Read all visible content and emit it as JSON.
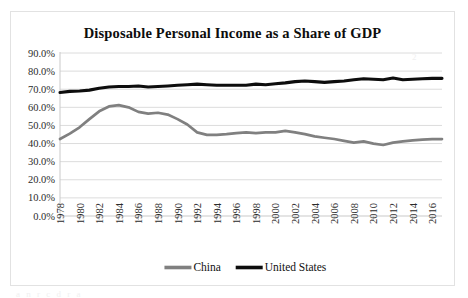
{
  "chart": {
    "title": "Disposable Personal Income as a Share of GDP",
    "frame_border_color": "#e2e2e2",
    "gridline_color": "#dcdcdc"
  },
  "legend": {
    "position": "bottom-center",
    "entries": [
      {
        "label": "China",
        "color": "#808080"
      },
      {
        "label": "United States",
        "color": "#0d0d0d"
      }
    ]
  },
  "artifacts": {
    "top_right_mark": "2",
    "footer_bleed": "a n  r  c  d  r  a"
  },
  "chart_data": {
    "type": "line",
    "title": "Disposable Personal Income as a Share of GDP",
    "xlabel": "",
    "ylabel": "",
    "grid": true,
    "legend_position": "bottom-center",
    "ylim": [
      0,
      0.9
    ],
    "ytick_labels": [
      "0.0%",
      "10.0%",
      "20.0%",
      "30.0%",
      "40.0%",
      "50.0%",
      "60.0%",
      "70.0%",
      "80.0%",
      "90.0%"
    ],
    "ytick_values": [
      0,
      0.1,
      0.2,
      0.3,
      0.4,
      0.5,
      0.6,
      0.7,
      0.8,
      0.9
    ],
    "x": [
      1978,
      1979,
      1980,
      1981,
      1982,
      1983,
      1984,
      1985,
      1986,
      1987,
      1988,
      1989,
      1990,
      1991,
      1992,
      1993,
      1994,
      1995,
      1996,
      1997,
      1998,
      1999,
      2000,
      2001,
      2002,
      2003,
      2004,
      2005,
      2006,
      2007,
      2008,
      2009,
      2010,
      2011,
      2012,
      2013,
      2014,
      2015,
      2016,
      2017
    ],
    "xtick_labels": [
      "1978",
      "1980",
      "1982",
      "1984",
      "1986",
      "1988",
      "1990",
      "1992",
      "1994",
      "1996",
      "1998",
      "2000",
      "2002",
      "2004",
      "2006",
      "2008",
      "2010",
      "2012",
      "2014",
      "2016"
    ],
    "xtick_values": [
      1978,
      1980,
      1982,
      1984,
      1986,
      1988,
      1990,
      1992,
      1994,
      1996,
      1998,
      2000,
      2002,
      2004,
      2006,
      2008,
      2010,
      2012,
      2014,
      2016
    ],
    "xlim": [
      1978,
      2017
    ],
    "series": [
      {
        "name": "China",
        "color": "#808080",
        "values": [
          0.425,
          0.455,
          0.49,
          0.535,
          0.578,
          0.605,
          0.612,
          0.6,
          0.575,
          0.565,
          0.57,
          0.56,
          0.535,
          0.505,
          0.462,
          0.448,
          0.448,
          0.452,
          0.458,
          0.462,
          0.458,
          0.462,
          0.462,
          0.47,
          0.462,
          0.452,
          0.44,
          0.432,
          0.425,
          0.415,
          0.405,
          0.412,
          0.4,
          0.392,
          0.405,
          0.412,
          0.418,
          0.422,
          0.425,
          0.425
        ]
      },
      {
        "name": "United States",
        "color": "#0d0d0d",
        "values": [
          0.682,
          0.688,
          0.69,
          0.695,
          0.705,
          0.712,
          0.715,
          0.715,
          0.718,
          0.712,
          0.715,
          0.718,
          0.722,
          0.725,
          0.728,
          0.725,
          0.722,
          0.722,
          0.722,
          0.722,
          0.728,
          0.725,
          0.73,
          0.735,
          0.742,
          0.745,
          0.742,
          0.738,
          0.742,
          0.745,
          0.752,
          0.758,
          0.755,
          0.752,
          0.762,
          0.752,
          0.755,
          0.758,
          0.76,
          0.76
        ]
      }
    ]
  }
}
